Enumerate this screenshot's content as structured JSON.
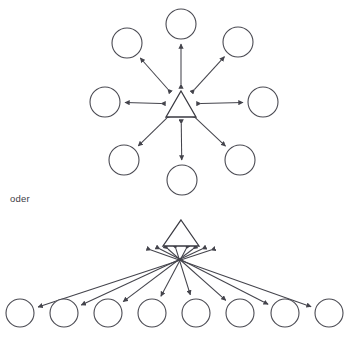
{
  "figure": {
    "connector_text": "oder",
    "connector_position": {
      "x": 10,
      "y": 194
    },
    "colors": {
      "background": "#ffffff",
      "node_stroke": "#4a4a52",
      "hub_stroke": "#3a3a42",
      "link_stroke": "#44444c",
      "text": "#3d3d45"
    }
  },
  "chart_data": {
    "type": "diagram",
    "title": "",
    "subtitle": "",
    "layout_hints": {
      "width": 352,
      "height": 350,
      "grid": false,
      "legend": "none",
      "arrowheads": "double",
      "hub_shape": "triangle",
      "node_shape": "circle"
    },
    "diagrams": [
      {
        "name": "radial-star-topology",
        "layout": "radial",
        "hub": {
          "id": "hub-top",
          "shape": "triangle",
          "cx": 181,
          "cy": 104,
          "half_width": 15,
          "half_height": 13
        },
        "nodes": [
          {
            "id": "n1",
            "cx": 181,
            "cy": 24,
            "r": 15,
            "direction": "north"
          },
          {
            "id": "n2",
            "cx": 238,
            "cy": 42,
            "r": 15,
            "direction": "northeast"
          },
          {
            "id": "n3",
            "cx": 263,
            "cy": 102,
            "r": 15,
            "direction": "east"
          },
          {
            "id": "n4",
            "cx": 240,
            "cy": 160,
            "r": 15,
            "direction": "southeast"
          },
          {
            "id": "n5",
            "cx": 182,
            "cy": 180,
            "r": 15,
            "direction": "south"
          },
          {
            "id": "n6",
            "cx": 124,
            "cy": 160,
            "r": 15,
            "direction": "southwest"
          },
          {
            "id": "n7",
            "cx": 105,
            "cy": 102,
            "r": 15,
            "direction": "west"
          },
          {
            "id": "n8",
            "cx": 127,
            "cy": 43,
            "r": 15,
            "direction": "northwest"
          }
        ],
        "edges": [
          {
            "from": "hub-top",
            "to": "n1",
            "bidirectional": true
          },
          {
            "from": "hub-top",
            "to": "n2",
            "bidirectional": true
          },
          {
            "from": "hub-top",
            "to": "n3",
            "bidirectional": true
          },
          {
            "from": "hub-top",
            "to": "n4",
            "bidirectional": true
          },
          {
            "from": "hub-top",
            "to": "n5",
            "bidirectional": true
          },
          {
            "from": "hub-top",
            "to": "n6",
            "bidirectional": true
          },
          {
            "from": "hub-top",
            "to": "n7",
            "bidirectional": true
          },
          {
            "from": "hub-top",
            "to": "n8",
            "bidirectional": true
          }
        ]
      },
      {
        "name": "fan-hub-topology",
        "layout": "fan",
        "hub": {
          "id": "hub-bottom",
          "shape": "triangle",
          "cx": 181,
          "cy": 233,
          "half_width": 18,
          "half_height": 13
        },
        "nodes": [
          {
            "id": "m1",
            "cx": 20,
            "cy": 313,
            "r": 14
          },
          {
            "id": "m2",
            "cx": 64,
            "cy": 313,
            "r": 14
          },
          {
            "id": "m3",
            "cx": 108,
            "cy": 313,
            "r": 14
          },
          {
            "id": "m4",
            "cx": 152,
            "cy": 313,
            "r": 14
          },
          {
            "id": "m5",
            "cx": 196,
            "cy": 313,
            "r": 14
          },
          {
            "id": "m6",
            "cx": 240,
            "cy": 313,
            "r": 14
          },
          {
            "id": "m7",
            "cx": 285,
            "cy": 313,
            "r": 14
          },
          {
            "id": "m8",
            "cx": 329,
            "cy": 313,
            "r": 14
          }
        ],
        "fan_origins": [
          {
            "for": "m1",
            "x": 211,
            "y": 250
          },
          {
            "for": "m2",
            "x": 202,
            "y": 249
          },
          {
            "for": "m3",
            "x": 193,
            "y": 249
          },
          {
            "for": "m4",
            "x": 186,
            "y": 249
          },
          {
            "for": "m5",
            "x": 176,
            "y": 249
          },
          {
            "for": "m6",
            "x": 168,
            "y": 249
          },
          {
            "for": "m7",
            "x": 160,
            "y": 249
          },
          {
            "for": "m8",
            "x": 151,
            "y": 250
          }
        ],
        "edges": [
          {
            "from": "hub-bottom",
            "to": "m1",
            "bidirectional": true
          },
          {
            "from": "hub-bottom",
            "to": "m2",
            "bidirectional": true
          },
          {
            "from": "hub-bottom",
            "to": "m3",
            "bidirectional": true
          },
          {
            "from": "hub-bottom",
            "to": "m4",
            "bidirectional": true
          },
          {
            "from": "hub-bottom",
            "to": "m5",
            "bidirectional": true
          },
          {
            "from": "hub-bottom",
            "to": "m6",
            "bidirectional": true
          },
          {
            "from": "hub-bottom",
            "to": "m7",
            "bidirectional": true
          },
          {
            "from": "hub-bottom",
            "to": "m8",
            "bidirectional": true
          }
        ]
      }
    ],
    "annotations": [
      {
        "text": "oder",
        "x": 10,
        "y": 194
      }
    ]
  }
}
